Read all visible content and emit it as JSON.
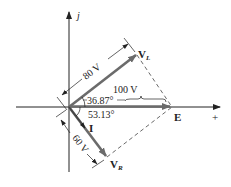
{
  "diagram": {
    "axes": {
      "imag_label": "j",
      "real_label": "+"
    },
    "phasors": {
      "VL": {
        "label": "V",
        "subscript": "L",
        "magnitude": "80 V"
      },
      "E": {
        "label": "E",
        "magnitude": "100 V"
      },
      "VR": {
        "label": "V",
        "subscript": "R",
        "magnitude": "60 V"
      },
      "I": {
        "label": "I"
      }
    },
    "angles": {
      "upper": "36.87°",
      "lower": "53.13°"
    },
    "colors": {
      "axis": "#222222",
      "phasor": "#6b6b6b",
      "dashed": "#444444"
    }
  }
}
